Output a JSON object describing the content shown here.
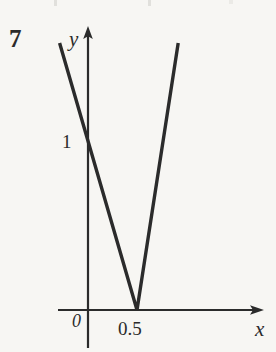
{
  "figure": {
    "problem_number": "7",
    "background_color": "#f7f6f3",
    "ink_color": "#2b2b2b"
  },
  "axes": {
    "x_axis_label": "x",
    "y_axis_label": "y",
    "origin_label": "0"
  },
  "ticks": {
    "y_tick_label": "1",
    "x_tick_label": "0.5"
  },
  "chart_data": {
    "type": "line",
    "title": "",
    "subtitle": "",
    "xlabel": "x",
    "ylabel": "y",
    "legend": [],
    "legend_position": "none",
    "grid": false,
    "axis_arrows": true,
    "xlim": [
      -0.32,
      1.22
    ],
    "ylim": [
      -0.28,
      2.05
    ],
    "x_tick_values": [
      0.5
    ],
    "x_tick_labels": [
      "0.5"
    ],
    "y_tick_values": [
      1
    ],
    "y_tick_labels": [
      "1"
    ],
    "origin_label": "0",
    "annotations": [
      {
        "text": "7",
        "role": "problem-number",
        "x_px": 12,
        "y_px": 28
      }
    ],
    "series": [
      {
        "name": "y = |2x - 1|",
        "type": "piecewise-linear",
        "x": [
          -0.29,
          0.5,
          0.92
        ],
        "values": [
          1.58,
          0.0,
          1.58
        ],
        "vertex": [
          0.5,
          0
        ],
        "y_intercept": 1,
        "slopes": [
          -2,
          2
        ]
      }
    ]
  }
}
